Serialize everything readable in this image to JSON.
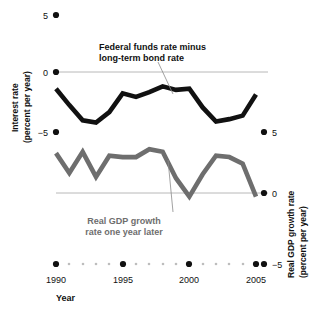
{
  "chart_data": {
    "type": "line",
    "title": "",
    "xlabel": "Year",
    "x": [
      1990,
      1991,
      1992,
      1993,
      1994,
      1995,
      1996,
      1997,
      1998,
      1999,
      2000,
      2001,
      2002,
      2003,
      2004,
      2005
    ],
    "xticks": [
      1990,
      1995,
      2000,
      2005
    ],
    "xtick_labels": [
      "1990",
      "1995",
      "2000",
      "2005"
    ],
    "xlim": [
      1990,
      2005
    ],
    "grid": false,
    "legend_position": "inline-annotations",
    "axes": [
      {
        "id": "left",
        "label": "Interest rate (percent per year)",
        "label_line1": "Interest rate",
        "label_line2": "(percent per year)",
        "ticks": [
          5,
          0,
          -5
        ],
        "tick_labels": [
          "5",
          "0",
          "−5"
        ],
        "ylim": [
          -5,
          5
        ],
        "zero_line": 0
      },
      {
        "id": "right",
        "label": "Real GDP growth rate (percent per year)",
        "label_line1": "Real GDP growth rate",
        "label_line2": "(percent per year)",
        "ticks": [
          5,
          0,
          -5
        ],
        "tick_labels": [
          "5",
          "0",
          "−5"
        ],
        "ylim": [
          -5,
          5
        ],
        "zero_line": 0
      }
    ],
    "series": [
      {
        "name": "Federal funds rate minus long-term bond rate",
        "axis": "left",
        "color": "#111111",
        "annotation_line1": "Federal funds rate minus",
        "annotation_line2": "long-term bond rate",
        "values": [
          -1.3,
          -2.7,
          -4.0,
          -4.2,
          -3.3,
          -1.7,
          -2.0,
          -1.6,
          -1.1,
          -1.4,
          -1.3,
          -2.9,
          -4.1,
          -3.9,
          -3.6,
          -1.8
        ]
      },
      {
        "name": "Real GDP growth rate one year later",
        "axis": "right",
        "color": "#6e6e6e",
        "annotation_line1": "Real GDP growth",
        "annotation_line2": "rate one year later",
        "values": [
          3.4,
          1.9,
          3.5,
          1.6,
          3.2,
          3.1,
          3.1,
          3.7,
          3.5,
          1.5,
          0.1,
          1.8,
          3.2,
          3.1,
          2.6,
          0.1
        ]
      }
    ]
  },
  "annotations": {
    "series_black_line1": "Federal funds rate minus",
    "series_black_line2": "long-term bond rate",
    "series_gray_line1": "Real GDP growth",
    "series_gray_line2": "rate one year later"
  },
  "labels": {
    "left_axis_line1": "Interest rate",
    "left_axis_line2": "(percent per year)",
    "right_axis_line1": "Real GDP growth rate",
    "right_axis_line2": "(percent per year)",
    "x_axis_title": "Year",
    "left_tick_top": "5",
    "left_tick_mid": "0",
    "left_tick_bot": "−5",
    "right_tick_top": "5",
    "right_tick_mid": "0",
    "right_tick_bot": "−5",
    "year_1990": "1990",
    "year_1995": "1995",
    "year_2000": "2000",
    "year_2005": "2005"
  },
  "colors": {
    "black_series": "#111111",
    "gray_series": "#6e6e6e",
    "zero_line": "#b8b8b8",
    "tick_dot": "#111111",
    "minor_dot": "#bdbdbd",
    "background": "#ffffff"
  }
}
